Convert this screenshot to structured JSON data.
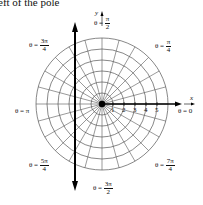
{
  "caption": "eft of the pole",
  "axes": {
    "x_label": "x",
    "y_label": "y"
  },
  "grid": {
    "circles": 6,
    "radial_lines": 24,
    "center_px": [
      102,
      104
    ],
    "step_px": 11
  },
  "radial_ticks": [
    "1",
    "2",
    "3",
    "4",
    "5"
  ],
  "angle_labels": {
    "zero": {
      "prefix": "θ = ",
      "value": "0"
    },
    "pi_over_4": {
      "prefix": "θ = ",
      "num": "π",
      "den": "4"
    },
    "pi_over_2": {
      "prefix": "θ = ",
      "num": "π",
      "den": "2"
    },
    "three_pi_over_4": {
      "prefix": "θ = ",
      "num": "3π",
      "den": "4"
    },
    "pi": {
      "prefix": "θ = ",
      "value": "π"
    },
    "five_pi_over_4": {
      "prefix": "θ = ",
      "num": "5π",
      "den": "4"
    },
    "three_pi_over_2": {
      "prefix": "θ = ",
      "num": "3π",
      "den": "2"
    },
    "seven_pi_over_4": {
      "prefix": "θ = ",
      "num": "7π",
      "den": "4"
    }
  },
  "vertical_line": {
    "x_px": 75,
    "description": "thick vertical line with arrows, left of the pole"
  },
  "colors": {
    "grid": "#555555",
    "axis": "#000000",
    "background": "#ffffff"
  }
}
